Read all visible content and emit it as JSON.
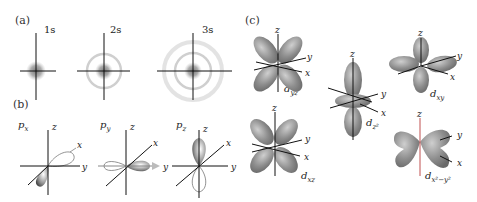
{
  "figure": {
    "panels": [
      {
        "id": "a",
        "label": "(a)",
        "title": "s orbitals",
        "items": [
          {
            "label": "1s"
          },
          {
            "label": "2s"
          },
          {
            "label": "3s"
          }
        ]
      },
      {
        "id": "b",
        "label": "(b)",
        "title": "p orbitals",
        "items": [
          {
            "label": "p",
            "sub": "x"
          },
          {
            "label": "p",
            "sub": "y"
          },
          {
            "label": "p",
            "sub": "z"
          }
        ]
      },
      {
        "id": "c",
        "label": "(c)",
        "title": "d orbitals",
        "items": [
          {
            "label": "d",
            "sub": "yz"
          },
          {
            "label": "d",
            "sub": "z²"
          },
          {
            "label": "d",
            "sub": "xy"
          },
          {
            "label": "d",
            "sub": "xz"
          },
          {
            "label": "d",
            "sub": "x²−y²"
          }
        ]
      }
    ],
    "axes": {
      "x": "x",
      "y": "y",
      "z": "z"
    },
    "colors": {
      "lobe": "#8a8a8a",
      "lobe_light": "#c4c4c4",
      "axis": "#111111",
      "cloud": "#777777",
      "background": "#ffffff"
    }
  }
}
